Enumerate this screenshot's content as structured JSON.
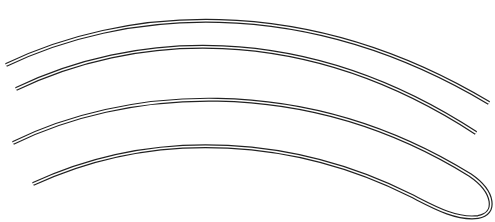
{
  "figure": {
    "colors": {
      "background": "#ffffff",
      "stroke": "#222222"
    },
    "wires": [
      {
        "id": "wire-1",
        "path": "M6,65 C120,10 300,-10 489,103"
      },
      {
        "id": "wire-2",
        "path": "M16,89 C130,34 300,18 476,133"
      },
      {
        "id": "hairpin",
        "path": "M13,143 C120,90 300,70 470,175 C495,192 497,214 478,217 C455,220 430,205 410,195 C300,140 160,125 33,184"
      }
    ]
  }
}
